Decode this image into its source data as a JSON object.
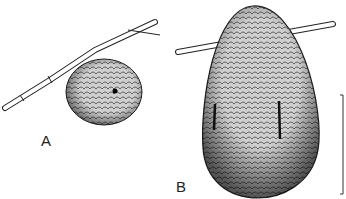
{
  "figure": {
    "panels": [
      {
        "label": "A",
        "subject": "small round nest on bamboo twig"
      },
      {
        "label": "B",
        "subject": "large egg-shaped nest on twig"
      }
    ],
    "scale_bar": {
      "present": true
    }
  },
  "colors": {
    "ink": "#222222",
    "fill": "#bdbdbd",
    "background": "#ffffff"
  }
}
